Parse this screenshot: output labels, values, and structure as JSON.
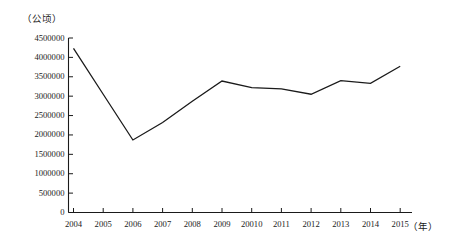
{
  "chart_data": {
    "type": "line",
    "title": "",
    "subtitle": "",
    "xlabel": "（年）",
    "ylabel": "（公顷）",
    "ylim": [
      0,
      4500000
    ],
    "grid": false,
    "legend": "none",
    "y_ticks": [
      0,
      500000,
      1000000,
      1500000,
      2000000,
      2500000,
      3000000,
      3500000,
      4000000,
      4500000
    ],
    "y_tick_labels": [
      "0",
      "500000",
      "1000000",
      "1500000",
      "2000000",
      "2500000",
      "3000000",
      "3500000",
      "4000000",
      "4500000"
    ],
    "categories": [
      "2004",
      "2005",
      "2006",
      "2007",
      "2008",
      "2009",
      "20010",
      "2011",
      "2012",
      "2013",
      "2014",
      "2015"
    ],
    "series": [
      {
        "name": "面积",
        "values": [
          4230000,
          3050000,
          1870000,
          2320000,
          2870000,
          3390000,
          3220000,
          3190000,
          3050000,
          3400000,
          3330000,
          3770000
        ]
      }
    ],
    "annotations": []
  },
  "axes": {
    "y_unit_label": "（公顷）",
    "x_unit_label": "（年）"
  }
}
